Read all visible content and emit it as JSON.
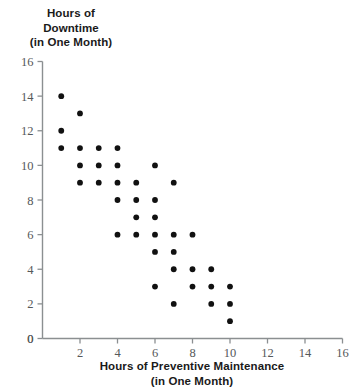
{
  "chart_data": {
    "type": "scatter",
    "title": "",
    "xlabel": "Hours of Preventive Maintenance (in One Month)",
    "ylabel": "Hours of Downtime (in One Month)",
    "xlim": [
      0,
      16
    ],
    "ylim": [
      0,
      16
    ],
    "xticks": [
      0,
      2,
      4,
      6,
      8,
      10,
      12,
      14,
      16
    ],
    "yticks": [
      0,
      2,
      4,
      6,
      8,
      10,
      12,
      14,
      16
    ],
    "grid": false,
    "legend": null,
    "marker": "filled-circle",
    "marker_color": "#111111",
    "points": [
      {
        "x": 1,
        "y": 14
      },
      {
        "x": 2,
        "y": 13
      },
      {
        "x": 1,
        "y": 12
      },
      {
        "x": 1,
        "y": 11
      },
      {
        "x": 2,
        "y": 11
      },
      {
        "x": 3,
        "y": 11
      },
      {
        "x": 4,
        "y": 11
      },
      {
        "x": 2,
        "y": 10
      },
      {
        "x": 3,
        "y": 10
      },
      {
        "x": 4,
        "y": 10
      },
      {
        "x": 6,
        "y": 10
      },
      {
        "x": 2,
        "y": 9
      },
      {
        "x": 3,
        "y": 9
      },
      {
        "x": 4,
        "y": 9
      },
      {
        "x": 5,
        "y": 9
      },
      {
        "x": 7,
        "y": 9
      },
      {
        "x": 4,
        "y": 8
      },
      {
        "x": 5,
        "y": 8
      },
      {
        "x": 6,
        "y": 8
      },
      {
        "x": 5,
        "y": 7
      },
      {
        "x": 6,
        "y": 7
      },
      {
        "x": 4,
        "y": 6
      },
      {
        "x": 5,
        "y": 6
      },
      {
        "x": 6,
        "y": 6
      },
      {
        "x": 7,
        "y": 6
      },
      {
        "x": 8,
        "y": 6
      },
      {
        "x": 6,
        "y": 5
      },
      {
        "x": 7,
        "y": 5
      },
      {
        "x": 7,
        "y": 4
      },
      {
        "x": 8,
        "y": 4
      },
      {
        "x": 9,
        "y": 4
      },
      {
        "x": 6,
        "y": 3
      },
      {
        "x": 8,
        "y": 3
      },
      {
        "x": 9,
        "y": 3
      },
      {
        "x": 10,
        "y": 3
      },
      {
        "x": 7,
        "y": 2
      },
      {
        "x": 9,
        "y": 2
      },
      {
        "x": 10,
        "y": 2
      },
      {
        "x": 10,
        "y": 1
      }
    ]
  },
  "axes": {
    "y_title_lines": [
      "Hours of",
      "Downtime",
      "(in One Month)"
    ],
    "x_title_line1": "Hours of Preventive Maintenance",
    "x_title_line2": "(in One Month)"
  },
  "colors": {
    "marker": "#111111",
    "axis": "#8b8f91",
    "tick_text": "#55585a",
    "title_text": "#1a1a1a",
    "background": "#ffffff"
  }
}
